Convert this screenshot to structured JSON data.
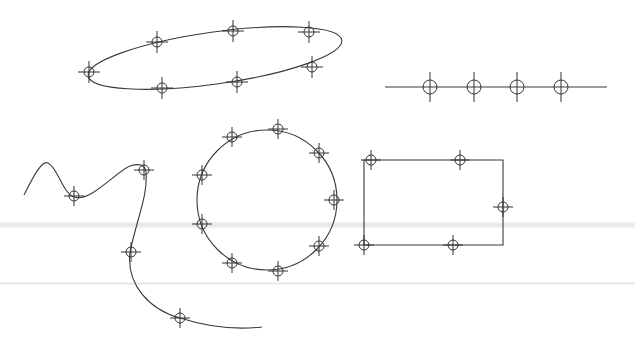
{
  "canvas": {
    "width": 635,
    "height": 353,
    "background": "#ffffff",
    "stroke_color": "#3a3a3a"
  },
  "bands": [
    {
      "y": 222,
      "height": 6,
      "color": "#e6e6e6"
    },
    {
      "y": 282,
      "height": 3,
      "color": "#e8e8e8"
    }
  ],
  "shapes": {
    "ellipse": {
      "type": "ellipse",
      "center": [
        215,
        58
      ],
      "rx": 128,
      "ry": 26,
      "rotation_deg": -8,
      "markers": [
        [
          89,
          72
        ],
        [
          157,
          42
        ],
        [
          233,
          31
        ],
        [
          309,
          32
        ],
        [
          312,
          67
        ],
        [
          237,
          82
        ],
        [
          162,
          88
        ]
      ]
    },
    "line": {
      "type": "line",
      "from": [
        385,
        87
      ],
      "to": [
        607,
        87
      ],
      "markers": [
        [
          430,
          87
        ],
        [
          474,
          87
        ],
        [
          517,
          87
        ],
        [
          561,
          87
        ]
      ]
    },
    "spline": {
      "type": "spline",
      "path": "M24,195 C34,175 42,160 48,163 C58,168 62,192 74,197 C90,203 118,170 130,166 C140,163 145,165 146,172 C148,195 138,215 130,252 C126,285 150,310 180,318 C205,326 235,330 262,327",
      "markers": [
        [
          74,
          196
        ],
        [
          144,
          170
        ],
        [
          131,
          252
        ],
        [
          180,
          318
        ]
      ]
    },
    "circle": {
      "type": "circle",
      "center": [
        267,
        200
      ],
      "r": 70,
      "markers": [
        [
          278,
          129
        ],
        [
          232,
          137
        ],
        [
          319,
          153
        ],
        [
          202,
          175
        ],
        [
          334,
          200
        ],
        [
          202,
          224
        ],
        [
          319,
          246
        ],
        [
          232,
          263
        ],
        [
          278,
          271
        ]
      ]
    },
    "rectangle": {
      "type": "polyline",
      "points": "364,160 503,160 503,245 364,245 364,160",
      "markers": [
        [
          371,
          160
        ],
        [
          460,
          160
        ],
        [
          503,
          207
        ],
        [
          364,
          245
        ],
        [
          453,
          245
        ]
      ]
    }
  }
}
